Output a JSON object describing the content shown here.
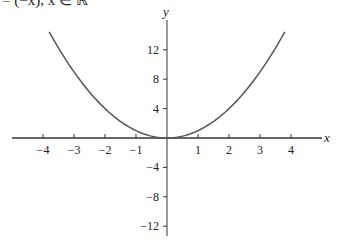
{
  "caption": "= (−x), x ∈ ℝ",
  "chart_data": {
    "type": "line",
    "title": "",
    "xlabel": "x",
    "ylabel": "y",
    "function": "y = x^2",
    "x_range_plotted": [
      -3.8,
      3.8
    ],
    "xlim": [
      -5.1,
      5.0
    ],
    "ylim": [
      -13.5,
      16.5
    ],
    "x_ticks": [
      -4,
      -3,
      -2,
      -1,
      1,
      2,
      3,
      4
    ],
    "y_ticks": [
      12,
      8,
      4,
      -4,
      -8,
      -12
    ],
    "grid": false,
    "legend": null,
    "series": [
      {
        "name": "y = x^2",
        "color": "#555555",
        "x": [
          -3.8,
          -3,
          -2,
          -1,
          0,
          1,
          2,
          3,
          3.8
        ],
        "y": [
          14.44,
          9,
          4,
          1,
          0,
          1,
          4,
          9,
          14.44
        ]
      }
    ]
  },
  "labels": {
    "x_axis": "x",
    "y_axis": "y",
    "x_ticks": [
      "−4",
      "−3",
      "−2",
      "−1",
      "1",
      "2",
      "3",
      "4"
    ],
    "y_ticks": [
      "12",
      "8",
      "4",
      "−4",
      "−8",
      "−12"
    ]
  }
}
